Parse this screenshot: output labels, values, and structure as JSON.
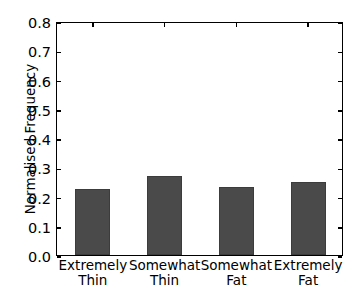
{
  "chart_data": {
    "type": "bar",
    "title": "",
    "xlabel": "",
    "ylabel": "Normalised Frequency",
    "categories": [
      "Extremely\nThin",
      "Somewhat\nThin",
      "Somewhat\nFat",
      "Extremely\nFat"
    ],
    "values": [
      0.226,
      0.27,
      0.233,
      0.25
    ],
    "ylim": [
      0.0,
      0.8
    ],
    "xlim": [
      0,
      4
    ],
    "yticks": [
      "0.0",
      "0.1",
      "0.2",
      "0.3",
      "0.4",
      "0.5",
      "0.6",
      "0.7",
      "0.8"
    ],
    "ytick_values": [
      0.0,
      0.1,
      0.2,
      0.3,
      0.4,
      0.5,
      0.6,
      0.7,
      0.8
    ],
    "grid": false,
    "legend": null,
    "bar_color": "#4a4a4a",
    "axis_color": "#000000",
    "background_color": "#ffffff"
  }
}
